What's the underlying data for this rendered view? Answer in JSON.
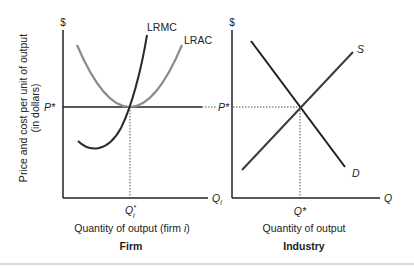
{
  "firm_panel": {
    "y_axis_symbol": "$",
    "y_axis_label_line1": "Price and cost per unit of output",
    "y_axis_label_line2": "(in dollars)",
    "price_label": "P*",
    "curves": {
      "lrmc_label": "LRMC",
      "lrac_label": "LRAC"
    },
    "x_axis_symbol": "Q",
    "x_axis_symbol_sub": "i",
    "q_star_label": "Q",
    "q_star_sup": "*",
    "q_star_sub": "i",
    "x_axis_label_prefix": "Quantity of output (firm ",
    "x_axis_label_italic": "i",
    "x_axis_label_suffix": ")",
    "title": "Firm"
  },
  "industry_panel": {
    "y_axis_symbol": "$",
    "price_label": "P*",
    "curves": {
      "supply_label": "S",
      "demand_label": "D"
    },
    "x_axis_symbol": "Q",
    "q_star_label": "Q*",
    "x_axis_label": "Quantity of output",
    "title": "Industry"
  },
  "colors": {
    "axis": "#222222",
    "lrmc": "#2a2a2a",
    "lrac": "#8c8c8c",
    "supply": "#3a3a3a",
    "demand": "#1e1e1e",
    "dotted": "#555555",
    "separator": "#cccccc"
  }
}
